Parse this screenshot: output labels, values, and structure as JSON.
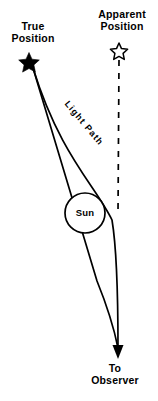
{
  "diagram": {
    "background_color": "#ffffff",
    "stroke_color": "#000000",
    "labels": {
      "true_position_line1": "True",
      "true_position_line2": "Position",
      "apparent_position_line1": "Apparent",
      "apparent_position_line2": "Position",
      "to_observer_line1": "To",
      "to_observer_line2": "Observer",
      "sun": "Sun",
      "light_path": "Light Path"
    },
    "markers": {
      "true_position_star": {
        "type": "filled-star",
        "x": 29,
        "y": 61,
        "size": 17
      },
      "apparent_position_star": {
        "type": "outline-star",
        "x": 119,
        "y": 50,
        "size": 14
      },
      "sun_circle": {
        "cx": 85,
        "cy": 213,
        "r": 20
      },
      "observer_arrowhead": {
        "x": 118,
        "y": 357
      }
    },
    "paths": {
      "light_path": {
        "style": "solid",
        "from": {
          "x": 33,
          "y": 68
        },
        "to": {
          "x": 118,
          "y": 352
        }
      },
      "sight_line": {
        "style": "dashed",
        "dash": "6 7",
        "from": {
          "x": 119,
          "y": 60
        },
        "to": {
          "x": 118,
          "y": 214
        }
      }
    }
  }
}
